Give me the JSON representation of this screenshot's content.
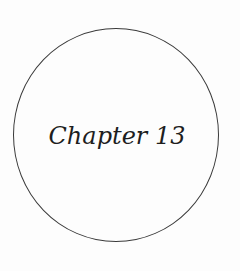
{
  "chapter": {
    "title": "Chapter 13"
  },
  "colors": {
    "background": "#fdfdfd",
    "circle_stroke": "#3a3a3a",
    "text": "#1e1e1e"
  }
}
